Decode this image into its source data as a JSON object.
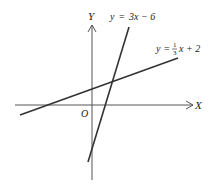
{
  "diagram": {
    "axes": {
      "x_label": "X",
      "y_label": "Y",
      "origin_label": "O"
    },
    "lines": [
      {
        "name": "steep-line",
        "label_lhs": "y",
        "label_eq": "=",
        "label_rhs": "3x − 6",
        "slope": 3,
        "intercept": -6
      },
      {
        "name": "shallow-line",
        "label_lhs": "y",
        "label_eq": "=",
        "frac_num": "1",
        "frac_den": "3",
        "label_rhs_tail": "x + 2",
        "slope": 0.3333,
        "intercept": 2
      }
    ],
    "stroke_color": "#333333"
  }
}
